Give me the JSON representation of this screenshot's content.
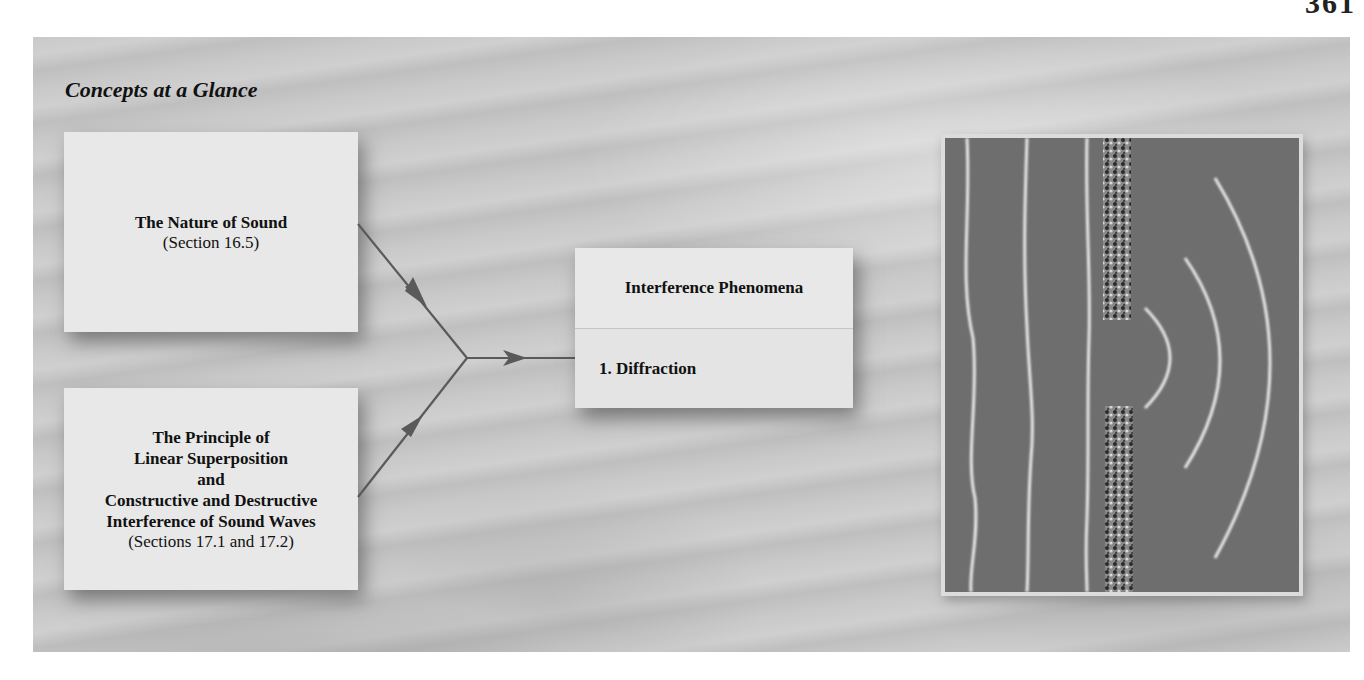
{
  "page": {
    "page_number_fragment": "361"
  },
  "panel": {
    "title": "Concepts at a Glance"
  },
  "concepts": {
    "nature_of_sound": {
      "heading": "The Nature of Sound",
      "reference": "(Section 16.5)"
    },
    "superposition": {
      "heading_lines": [
        "The Principle of",
        "Linear Superposition",
        "and",
        "Constructive and Destructive",
        "Interference of Sound Waves"
      ],
      "reference": "(Sections 17.1 and 17.2)"
    },
    "interference": {
      "heading": "Interference Phenomena",
      "items": [
        "1. Diffraction"
      ]
    }
  },
  "colors": {
    "panel_bg": "#c9c9c9",
    "box_bg": "#e8e8e8",
    "arrow": "#5a5a5a",
    "photo_bg": "#6e6e6e"
  }
}
